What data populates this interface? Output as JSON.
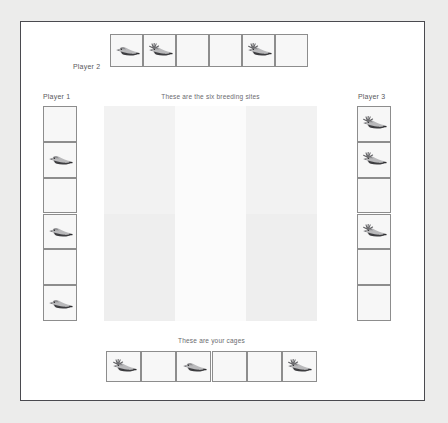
{
  "board": {
    "background_color": "#ececeb",
    "paper_color": "#ffffff",
    "frame_color": "#4a4a4f",
    "cell_border_color": "#8d8d8d",
    "cell_fill_color": "#f7f7f7",
    "label_color": "#58585c"
  },
  "captions": {
    "breeding_sites": "These are the six breeding sites",
    "cages": "These are your cages"
  },
  "players": {
    "player1": {
      "label": "Player 1",
      "orientation": "vertical",
      "position": "left",
      "cell_count": 6,
      "cells": [
        {
          "index": 1,
          "occupant": "empty"
        },
        {
          "index": 2,
          "occupant": "plain-bird"
        },
        {
          "index": 3,
          "occupant": "empty"
        },
        {
          "index": 4,
          "occupant": "plain-bird"
        },
        {
          "index": 5,
          "occupant": "empty"
        },
        {
          "index": 6,
          "occupant": "plain-bird"
        }
      ]
    },
    "player2": {
      "label": "Player 2",
      "orientation": "horizontal",
      "position": "top",
      "cell_count": 6,
      "cells": [
        {
          "index": 1,
          "occupant": "plain-bird"
        },
        {
          "index": 2,
          "occupant": "crested-bird"
        },
        {
          "index": 3,
          "occupant": "empty"
        },
        {
          "index": 4,
          "occupant": "empty"
        },
        {
          "index": 5,
          "occupant": "crested-bird"
        },
        {
          "index": 6,
          "occupant": "empty"
        }
      ]
    },
    "player3": {
      "label": "Player 3",
      "orientation": "vertical",
      "position": "right",
      "cell_count": 6,
      "cells": [
        {
          "index": 1,
          "occupant": "crested-bird"
        },
        {
          "index": 2,
          "occupant": "crested-bird"
        },
        {
          "index": 3,
          "occupant": "empty"
        },
        {
          "index": 4,
          "occupant": "crested-bird"
        },
        {
          "index": 5,
          "occupant": "empty"
        },
        {
          "index": 6,
          "occupant": "empty"
        }
      ]
    }
  },
  "cages": {
    "label": "These are your cages",
    "orientation": "horizontal",
    "position": "bottom",
    "cell_count": 6,
    "cells": [
      {
        "index": 1,
        "occupant": "crested-bird"
      },
      {
        "index": 2,
        "occupant": "empty"
      },
      {
        "index": 3,
        "occupant": "plain-bird"
      },
      {
        "index": 4,
        "occupant": "empty"
      },
      {
        "index": 5,
        "occupant": "empty"
      },
      {
        "index": 6,
        "occupant": "crested-bird"
      }
    ]
  },
  "breeding_sites": {
    "caption": "These are the six breeding sites",
    "columns": 3,
    "rows": 2,
    "site_count": 6,
    "sites": [
      {
        "index": 1,
        "row": 1,
        "column": 1,
        "occupant": "empty",
        "shade": "#f2f2f2"
      },
      {
        "index": 2,
        "row": 1,
        "column": 2,
        "occupant": "empty",
        "shade": "#fbfbfb"
      },
      {
        "index": 3,
        "row": 1,
        "column": 3,
        "occupant": "empty",
        "shade": "#f2f2f2"
      },
      {
        "index": 4,
        "row": 2,
        "column": 1,
        "occupant": "empty",
        "shade": "#eeeeee"
      },
      {
        "index": 5,
        "row": 2,
        "column": 2,
        "occupant": "empty",
        "shade": "#fbfbfb"
      },
      {
        "index": 6,
        "row": 2,
        "column": 3,
        "occupant": "empty",
        "shade": "#eeeeee"
      }
    ]
  },
  "icons": {
    "plain_bird": "plain-bird-icon",
    "crested_bird": "crested-bird-icon"
  }
}
